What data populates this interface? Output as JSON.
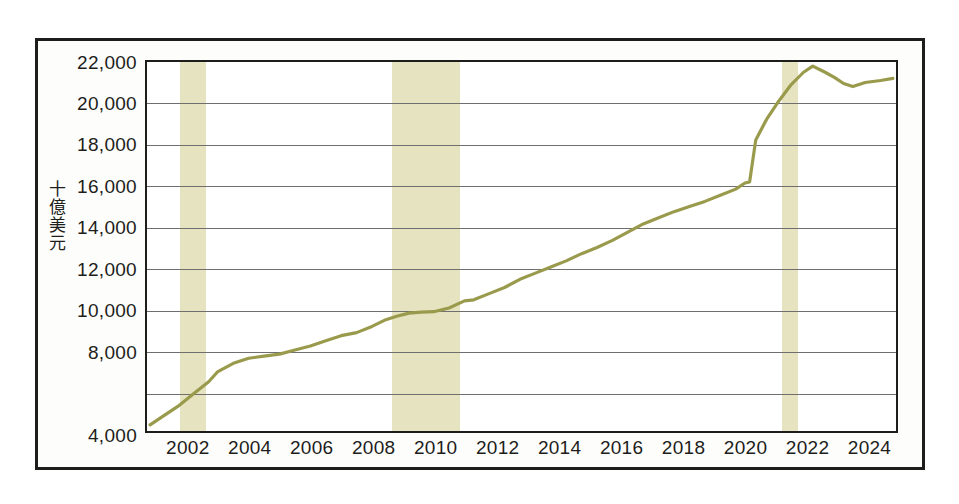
{
  "chart_data": {
    "type": "line",
    "title": "",
    "subtitle": "",
    "xlabel": "",
    "ylabel": "十億美元",
    "ylabel_chars": [
      "十",
      "億",
      "美",
      "元"
    ],
    "xlim": [
      2000.7,
      2025.0
    ],
    "ylim": [
      4000,
      22000
    ],
    "y_ticks": [
      4000,
      6000,
      8000,
      10000,
      12000,
      14000,
      16000,
      18000,
      20000,
      22000
    ],
    "y_tick_labels": [
      "4,000",
      "",
      "8,000",
      "10,000",
      "12,000",
      "14,000",
      "16,000",
      "18,000",
      "20,000",
      "22,000"
    ],
    "y_tick_labels_shown": [
      "4,000",
      "8,000",
      "10,000",
      "12,000",
      "14,000",
      "16,000",
      "18,000",
      "20,000",
      "22,000"
    ],
    "x_ticks": [
      2002,
      2004,
      2006,
      2008,
      2010,
      2012,
      2014,
      2016,
      2018,
      2020,
      2022,
      2024
    ],
    "x_tick_labels": [
      "2002",
      "2004",
      "2006",
      "2008",
      "2010",
      "2012",
      "2014",
      "2016",
      "2018",
      "2020",
      "2022",
      "2024"
    ],
    "grid": "horizontal",
    "legend": "none",
    "series": [
      {
        "name": "十億美元",
        "color": "#9a9a4d",
        "x": [
          2000.8,
          2001.2,
          2001.7,
          2002.2,
          2002.7,
          2003.0,
          2003.5,
          2004.0,
          2004.5,
          2005.0,
          2005.5,
          2006.0,
          2006.5,
          2007.0,
          2007.5,
          2008.0,
          2008.4,
          2008.8,
          2009.2,
          2009.6,
          2010.0,
          2010.5,
          2011.0,
          2011.3,
          2011.8,
          2012.3,
          2012.8,
          2013.3,
          2013.8,
          2014.3,
          2014.8,
          2015.3,
          2015.8,
          2016.3,
          2016.8,
          2017.3,
          2017.8,
          2018.3,
          2018.8,
          2019.3,
          2019.8,
          2020.1,
          2020.25,
          2020.45,
          2020.8,
          2021.2,
          2021.6,
          2022.0,
          2022.3,
          2022.7,
          2023.0,
          2023.3,
          2023.6,
          2024.0,
          2024.5,
          2024.9
        ],
        "values": [
          4300,
          4700,
          5200,
          5800,
          6400,
          6900,
          7300,
          7550,
          7650,
          7750,
          7950,
          8150,
          8400,
          8650,
          8800,
          9100,
          9400,
          9600,
          9750,
          9800,
          9820,
          10000,
          10350,
          10400,
          10700,
          11000,
          11400,
          11700,
          12000,
          12300,
          12650,
          12950,
          13300,
          13700,
          14100,
          14400,
          14700,
          14950,
          15200,
          15500,
          15800,
          16100,
          16150,
          18200,
          19200,
          20100,
          20900,
          21500,
          21800,
          21500,
          21250,
          20950,
          20800,
          21000,
          21100,
          21200
        ]
      }
    ],
    "annotations": {
      "recession_bands": [
        {
          "label": "2001-recession",
          "start": 2001.75,
          "end": 2002.6,
          "color": "#e6e3c0"
        },
        {
          "label": "2007-2009-recession",
          "start": 2008.6,
          "end": 2010.8,
          "color": "#e6e3c0"
        },
        {
          "label": "2020-recession",
          "start": 2021.18,
          "end": 2021.72,
          "color": "#e6e3c0"
        }
      ]
    }
  }
}
